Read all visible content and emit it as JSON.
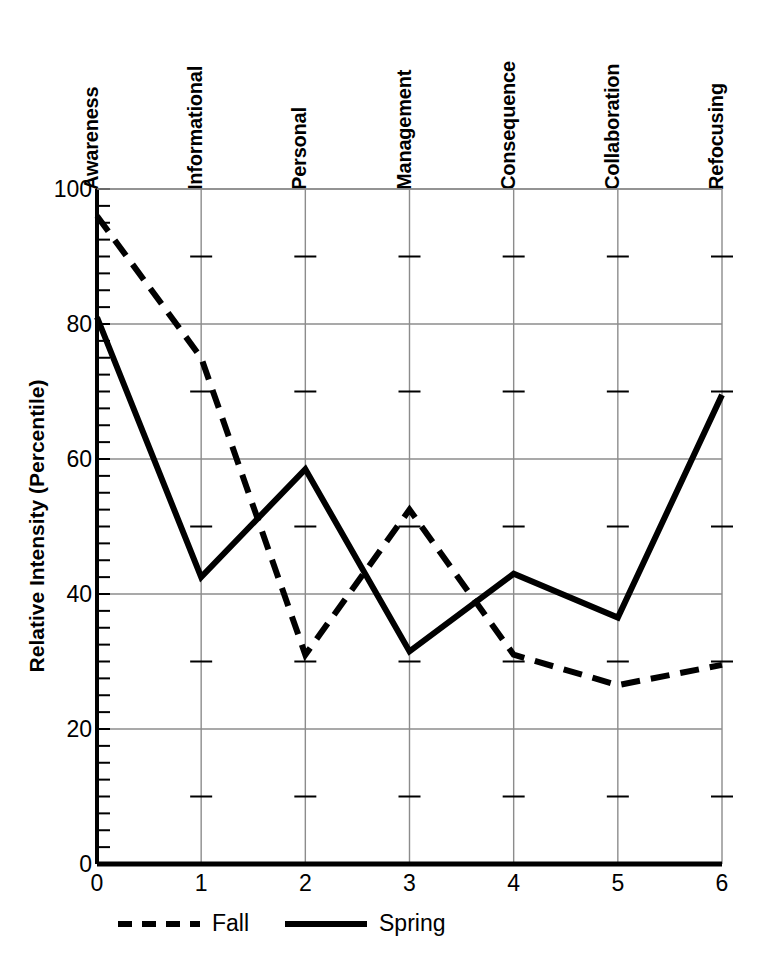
{
  "chart_data": {
    "type": "line",
    "title": "",
    "xlabel": "",
    "ylabel": "Relative Intensity (Percentile)",
    "xlim": [
      0,
      6
    ],
    "ylim": [
      0,
      100
    ],
    "grid": true,
    "x": [
      0,
      1,
      2,
      3,
      4,
      5,
      6
    ],
    "categories": [
      "Awareness",
      "Informational",
      "Personal",
      "Management",
      "Consequence",
      "Collaboration",
      "Refocusing"
    ],
    "x_tick_labels": [
      "0",
      "1",
      "2",
      "3",
      "4",
      "5",
      "6"
    ],
    "y_tick_labels": [
      "0",
      "20",
      "40",
      "60",
      "80",
      "100"
    ],
    "y_ticks": [
      0,
      20,
      40,
      60,
      80,
      100
    ],
    "y_minor_tick_step": 2.5,
    "legend_position": "below-axes",
    "series": [
      {
        "name": "Fall",
        "style": "dashed",
        "color": "#000000",
        "values": [
          96,
          75,
          31,
          52.5,
          31,
          26.5,
          29.5
        ]
      },
      {
        "name": "Spring",
        "style": "solid",
        "color": "#000000",
        "values": [
          81,
          42.5,
          58.5,
          31.5,
          43,
          36.5,
          69.5
        ]
      }
    ],
    "legend": [
      {
        "label": "Fall",
        "style": "dashed"
      },
      {
        "label": "Spring",
        "style": "solid"
      }
    ],
    "colors": {
      "line": "#000000",
      "grid": "#8c8c8c",
      "axis": "#000000",
      "background": "#ffffff"
    }
  }
}
